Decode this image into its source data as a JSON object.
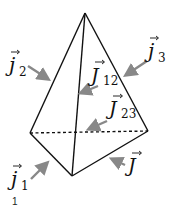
{
  "diagram": {
    "type": "tetrahedron with current vectors",
    "vertices": {
      "apex": [
        85,
        13
      ],
      "left": [
        30,
        133
      ],
      "right": [
        148,
        131
      ],
      "bottom": [
        72,
        176
      ]
    },
    "colors": {
      "edge": "#111111",
      "arrow": "#888888"
    },
    "labels": {
      "j2": {
        "base": "j",
        "sub": "2"
      },
      "j3": {
        "base": "j",
        "sub": "3"
      },
      "J12": {
        "base": "J",
        "sub": "12"
      },
      "J23": {
        "base": "J",
        "sub": "23"
      },
      "j1": {
        "base": "j",
        "sub": "1"
      },
      "J": {
        "base": "J",
        "sub": ""
      }
    },
    "footnote": "1"
  }
}
